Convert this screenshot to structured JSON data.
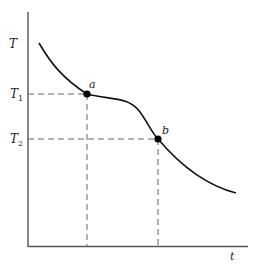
{
  "diagram": {
    "y_axis_label": "T",
    "x_axis_label": "t",
    "t1_label": "T",
    "t1_sub": "1",
    "t2_label": "T",
    "t2_sub": "2",
    "point_a_label": "a",
    "point_b_label": "b",
    "colors": {
      "axis": "#555555",
      "curve": "#111111",
      "dashed": "#666666",
      "point": "#000000"
    }
  }
}
